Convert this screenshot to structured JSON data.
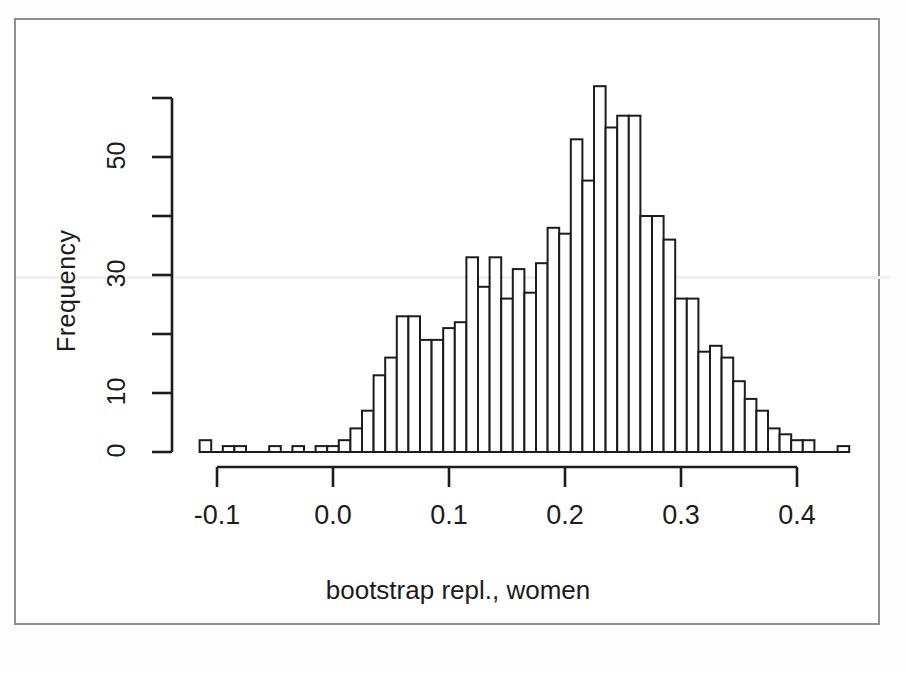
{
  "figure": {
    "kind": "histogram-figure",
    "background": "#ffffff",
    "frame_color": "#8e8e8e",
    "ink_color": "#1c1c1c"
  },
  "chart_data": {
    "type": "bar",
    "subtype": "histogram",
    "title": "",
    "xlabel": "bootstrap repl., women",
    "ylabel": "Frequency",
    "xlim": [
      -0.12,
      0.45
    ],
    "ylim": [
      0,
      62
    ],
    "grid": false,
    "legend": null,
    "bin_width": 0.01,
    "bar_fill": "#ffffff",
    "bar_stroke": "#1c1c1c",
    "xticks": [
      -0.1,
      0.0,
      0.1,
      0.2,
      0.3,
      0.4
    ],
    "xticklabels": [
      "-0.1",
      "0.0",
      "0.1",
      "0.2",
      "0.3",
      "0.4"
    ],
    "yticks": [
      0,
      10,
      20,
      30,
      40,
      50,
      60
    ],
    "yticklabels": [
      "0",
      "10",
      "",
      "30",
      "",
      "50",
      ""
    ],
    "ytick_labeled": [
      0,
      10,
      30,
      50
    ],
    "bin_starts": [
      -0.115,
      -0.105,
      -0.095,
      -0.085,
      -0.075,
      -0.065,
      -0.055,
      -0.045,
      -0.035,
      -0.025,
      -0.015,
      -0.005,
      0.005,
      0.015,
      0.025,
      0.035,
      0.045,
      0.055,
      0.065,
      0.075,
      0.085,
      0.095,
      0.105,
      0.115,
      0.125,
      0.135,
      0.145,
      0.155,
      0.165,
      0.175,
      0.185,
      0.195,
      0.205,
      0.215,
      0.225,
      0.235,
      0.245,
      0.255,
      0.265,
      0.275,
      0.285,
      0.295,
      0.305,
      0.315,
      0.325,
      0.335,
      0.345,
      0.355,
      0.365,
      0.375,
      0.385,
      0.395,
      0.405,
      0.415,
      0.425,
      0.435
    ],
    "values": [
      2,
      0,
      1,
      1,
      0,
      0,
      1,
      0,
      1,
      0,
      1,
      1,
      2,
      4,
      7,
      13,
      16,
      23,
      23,
      19,
      19,
      21,
      22,
      33,
      28,
      33,
      26,
      31,
      27,
      32,
      38,
      37,
      53,
      46,
      62,
      55,
      57,
      57,
      40,
      40,
      36,
      26,
      26,
      17,
      18,
      16,
      12,
      9,
      7,
      4,
      3,
      2,
      2,
      0,
      0,
      1
    ],
    "peak_value": 62,
    "peak_bin_start": 0.185,
    "n_bins": 56
  },
  "annotations": {
    "y_axis_label": "Frequency",
    "x_axis_label": "bootstrap repl., women"
  }
}
